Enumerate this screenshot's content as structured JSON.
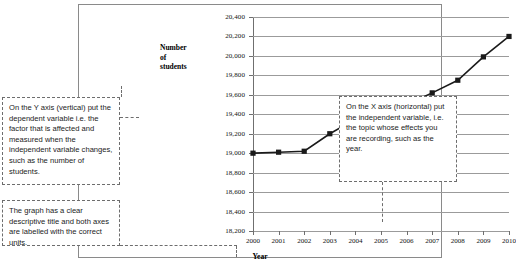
{
  "chart_data": {
    "type": "line",
    "title": "",
    "xlabel": "Year",
    "ylabel": "Number of students",
    "ylabel_lines": [
      "Number",
      "of",
      "students"
    ],
    "categories": [
      "2000",
      "2001",
      "2002",
      "2003",
      "2004",
      "2005",
      "2006",
      "2007",
      "2008",
      "2009",
      "2010"
    ],
    "values": [
      19000,
      19010,
      19020,
      19200,
      19350,
      19480,
      19500,
      19620,
      19750,
      19990,
      20200
    ],
    "ylim": [
      18200,
      20400
    ],
    "ytick_step": 200,
    "yticks": [
      "18,200",
      "18,400",
      "18,600",
      "18,800",
      "19,000",
      "19,200",
      "19,400",
      "19,600",
      "19,800",
      "20,000",
      "20,200",
      "20,400"
    ],
    "grid": true,
    "legend": "none",
    "marker": "square",
    "series_color": "#1a1a1a",
    "grid_color": "#9b9b9b"
  },
  "callouts": {
    "y_axis": "On the Y axis (vertical) put the dependent variable i.e. the factor that is affected and measured when the independent variable changes, such as the number of students.",
    "x_axis": "On the X axis (horizontal) put the independent variable, i.e. the topic whose effects you are recording, such as the year.",
    "title_units": "The graph has a clear descriptive title and both axes are labelled with the correct units."
  }
}
